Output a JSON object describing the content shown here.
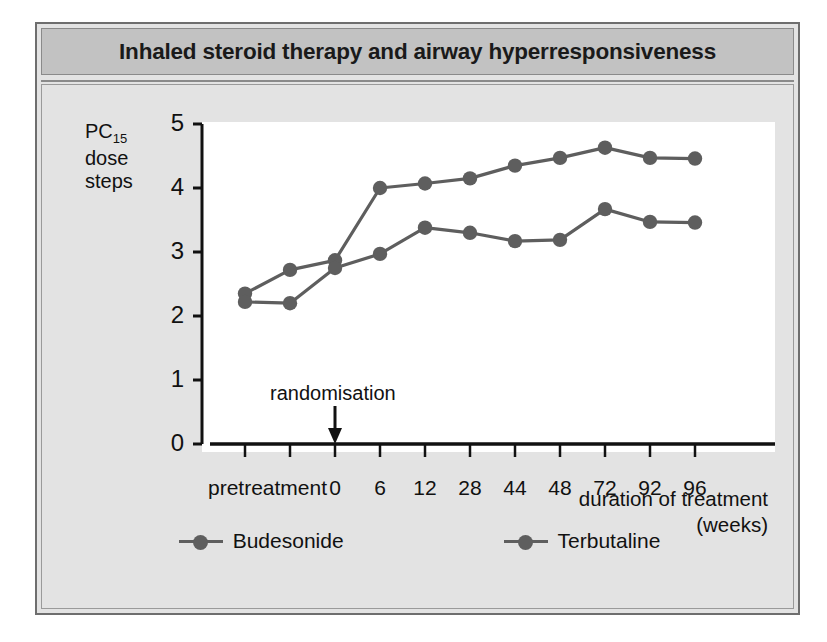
{
  "figure": {
    "title": "Inhaled steroid therapy and airway hyperresponsiveness"
  },
  "chart_data": {
    "type": "line",
    "title": "Inhaled steroid therapy and airway hyperresponsiveness",
    "xlabel": "duration of treatment (weeks)",
    "xlabel_line1": "duration of treatment",
    "xlabel_line2": "(weeks)",
    "ylabel": "PC15 dose steps",
    "ylabel_prefix": "PC",
    "ylabel_sub": "15",
    "ylabel_line2": "dose",
    "ylabel_line3": "steps",
    "ylim": [
      0,
      5
    ],
    "yticks": [
      0,
      1,
      2,
      3,
      4,
      5
    ],
    "ytick_labels": [
      "0",
      "1",
      "2",
      "3",
      "4",
      "5"
    ],
    "categories": [
      "pretreatment-1",
      "pretreatment-2",
      "0",
      "6",
      "12",
      "28",
      "44",
      "48",
      "72",
      "92",
      "96"
    ],
    "xtick_labels": [
      "",
      "",
      "0",
      "6",
      "12",
      "28",
      "44",
      "48",
      "72",
      "92",
      "96"
    ],
    "xgroup_label": "pretreatment",
    "grid": false,
    "legend_position": "below",
    "annotations": [
      {
        "text": "randomisation",
        "at_category": "0",
        "arrow": "down"
      }
    ],
    "series": [
      {
        "name": "Budesonide",
        "color": "#5e5e5e",
        "values": [
          2.35,
          2.72,
          2.87,
          4.0,
          4.07,
          4.15,
          4.35,
          4.47,
          4.63,
          4.47,
          4.46
        ]
      },
      {
        "name": "Terbutaline",
        "color": "#5e5e5e",
        "values": [
          2.22,
          2.2,
          2.75,
          2.97,
          3.38,
          3.3,
          3.17,
          3.19,
          3.67,
          3.47,
          3.46
        ]
      }
    ]
  },
  "colors": {
    "series": "#5e5e5e",
    "axis": "#111111",
    "panel_bg": "#e3e3e3",
    "title_bg": "#c2c2c2",
    "plot_bg": "#ffffff"
  }
}
